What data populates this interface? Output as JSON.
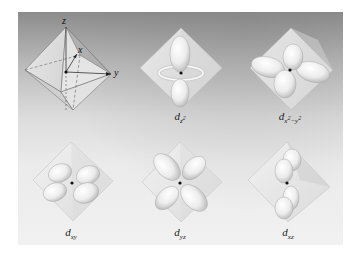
{
  "figure": {
    "background_top": "#8c8c8c",
    "background_bottom": "#f1f1f1",
    "reference": {
      "name": "octahedron-axes",
      "axis_labels": {
        "z": "z",
        "x": "x",
        "y": "y"
      }
    },
    "orbitals": [
      {
        "id": "dz2",
        "base": "d",
        "sub": "z",
        "sup": "2",
        "extra": ""
      },
      {
        "id": "dx2-y2",
        "base": "d",
        "sub": "x",
        "sup": "2",
        "extra": "−y",
        "extra_sup": "2"
      },
      {
        "id": "dxy",
        "base": "d",
        "sub": "xy",
        "sup": "",
        "extra": ""
      },
      {
        "id": "dyz",
        "base": "d",
        "sub": "yz",
        "sup": "",
        "extra": ""
      },
      {
        "id": "dxz",
        "base": "d",
        "sub": "xz",
        "sup": "",
        "extra": ""
      }
    ]
  }
}
